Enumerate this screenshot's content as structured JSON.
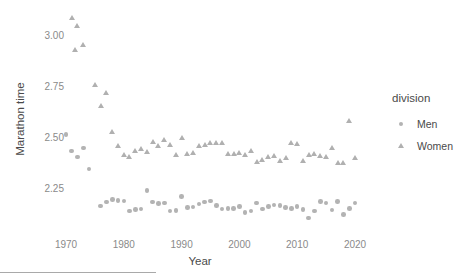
{
  "chart_data": {
    "type": "scatter",
    "title": "",
    "xlabel": "Year",
    "ylabel": "Marathon time",
    "xlim": [
      1966.5,
      2022.5
    ],
    "ylim": [
      2.14,
      3.12
    ],
    "grid": false,
    "legend": {
      "title": "division",
      "position": "right",
      "entries": [
        {
          "name": "Men",
          "marker": "circle",
          "color": "#b3b3b3"
        },
        {
          "name": "Women",
          "marker": "triangle",
          "color": "#b0b0b0"
        }
      ]
    },
    "xticks": [
      1970,
      1980,
      1990,
      2000,
      2010,
      2020
    ],
    "xtick_labels": [
      "1970",
      "1980",
      "1990",
      "2000",
      "2010",
      "2020"
    ],
    "yticks": [
      2.25,
      2.5,
      2.75,
      3.0
    ],
    "ytick_labels": [
      "2.25",
      "2.50",
      "2.75",
      "3.00"
    ],
    "series": [
      {
        "name": "Men",
        "marker": "circle",
        "color": "#b3b3b3",
        "points": [
          [
            1970,
            2.522
          ],
          [
            1971,
            2.442
          ],
          [
            1972,
            2.412
          ],
          [
            1973,
            2.456
          ],
          [
            1974,
            2.353
          ],
          [
            1976,
            2.172
          ],
          [
            1977,
            2.192
          ],
          [
            1978,
            2.204
          ],
          [
            1979,
            2.198
          ],
          [
            1980,
            2.196
          ],
          [
            1981,
            2.148
          ],
          [
            1982,
            2.155
          ],
          [
            1983,
            2.156
          ],
          [
            1984,
            2.249
          ],
          [
            1985,
            2.191
          ],
          [
            1986,
            2.183
          ],
          [
            1987,
            2.186
          ],
          [
            1988,
            2.147
          ],
          [
            1989,
            2.149
          ],
          [
            1990,
            2.217
          ],
          [
            1991,
            2.163
          ],
          [
            1992,
            2.167
          ],
          [
            1993,
            2.182
          ],
          [
            1994,
            2.191
          ],
          [
            1995,
            2.197
          ],
          [
            1996,
            2.174
          ],
          [
            1997,
            2.157
          ],
          [
            1998,
            2.158
          ],
          [
            1999,
            2.16
          ],
          [
            2000,
            2.168
          ],
          [
            2001,
            2.141
          ],
          [
            2002,
            2.148
          ],
          [
            2003,
            2.186
          ],
          [
            2004,
            2.157
          ],
          [
            2005,
            2.17
          ],
          [
            2006,
            2.176
          ],
          [
            2007,
            2.174
          ],
          [
            2008,
            2.163
          ],
          [
            2009,
            2.158
          ],
          [
            2010,
            2.17
          ],
          [
            2011,
            2.153
          ],
          [
            2012,
            2.112
          ],
          [
            2013,
            2.147
          ],
          [
            2014,
            2.194
          ],
          [
            2015,
            2.187
          ],
          [
            2016,
            2.152
          ],
          [
            2017,
            2.193
          ],
          [
            2018,
            2.131
          ],
          [
            2019,
            2.158
          ],
          [
            2020,
            2.186
          ]
        ]
      },
      {
        "name": "Women",
        "marker": "triangle",
        "color": "#b0b0b0",
        "points": [
          [
            1971,
            3.093
          ],
          [
            1972,
            3.055
          ],
          [
            1971.5,
            2.938
          ],
          [
            1973,
            2.962
          ],
          [
            1975,
            2.768
          ],
          [
            1976,
            2.665
          ],
          [
            1977,
            2.725
          ],
          [
            1978,
            2.533
          ],
          [
            1979,
            2.468
          ],
          [
            1980,
            2.421
          ],
          [
            1981,
            2.414
          ],
          [
            1982,
            2.444
          ],
          [
            1983,
            2.45
          ],
          [
            1984,
            2.436
          ],
          [
            1985,
            2.488
          ],
          [
            1986,
            2.469
          ],
          [
            1987,
            2.498
          ],
          [
            1988,
            2.473
          ],
          [
            1989,
            2.424
          ],
          [
            1990,
            2.506
          ],
          [
            1991,
            2.428
          ],
          [
            1992,
            2.43
          ],
          [
            1993,
            2.468
          ],
          [
            1994,
            2.474
          ],
          [
            1995,
            2.48
          ],
          [
            1996,
            2.483
          ],
          [
            1997,
            2.482
          ],
          [
            1998,
            2.426
          ],
          [
            1999,
            2.428
          ],
          [
            2000,
            2.43
          ],
          [
            2001,
            2.424
          ],
          [
            2002,
            2.443
          ],
          [
            2003,
            2.386
          ],
          [
            2004,
            2.396
          ],
          [
            2005,
            2.412
          ],
          [
            2006,
            2.416
          ],
          [
            2007,
            2.391
          ],
          [
            2008,
            2.407
          ],
          [
            2009,
            2.481
          ],
          [
            2010,
            2.478
          ],
          [
            2011,
            2.393
          ],
          [
            2012,
            2.423
          ],
          [
            2013,
            2.428
          ],
          [
            2014,
            2.42
          ],
          [
            2015,
            2.414
          ],
          [
            2016,
            2.457
          ],
          [
            2017,
            2.383
          ],
          [
            2018,
            2.385
          ],
          [
            2019,
            2.587
          ],
          [
            2020,
            2.409
          ]
        ]
      }
    ]
  },
  "axis": {
    "x_title": "Year",
    "y_title": "Marathon time"
  },
  "legend": {
    "title": "division",
    "men_label": "Men",
    "women_label": "Women"
  }
}
